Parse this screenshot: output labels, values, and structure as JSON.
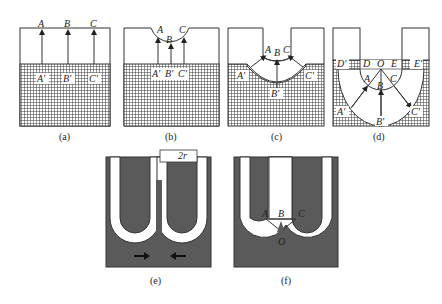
{
  "figure": {
    "panels": [
      {
        "id": "a",
        "caption": "(a)",
        "labels": {
          "top": [
            "A",
            "B",
            "C"
          ],
          "bottom": [
            "A'",
            "B'",
            "C'"
          ]
        }
      },
      {
        "id": "b",
        "caption": "(b)",
        "labels": {
          "top": [
            "A",
            "B",
            "C"
          ],
          "bottom": [
            "A'",
            "B'",
            "C'"
          ]
        }
      },
      {
        "id": "c",
        "caption": "(c)",
        "labels": {
          "top": [
            "A",
            "B",
            "C"
          ],
          "bottom": [
            "A'",
            "B'",
            "C'"
          ]
        }
      },
      {
        "id": "d",
        "caption": "(d)",
        "labels": {
          "top": [
            "A",
            "B",
            "C"
          ],
          "bottom": [
            "A'",
            "B'",
            "C'"
          ],
          "center": "O",
          "line": [
            "D'",
            "D",
            "E",
            "E'"
          ]
        }
      },
      {
        "id": "e",
        "caption": "(e)",
        "labels": {
          "width": "2r"
        }
      },
      {
        "id": "f",
        "caption": "(f)",
        "labels": {
          "top": [
            "A",
            "B",
            "C"
          ],
          "center": "O"
        }
      }
    ]
  },
  "colors": {
    "outline": "#333333",
    "grid": "#444444",
    "fill_dark": "#555555",
    "background": "#ffffff"
  }
}
